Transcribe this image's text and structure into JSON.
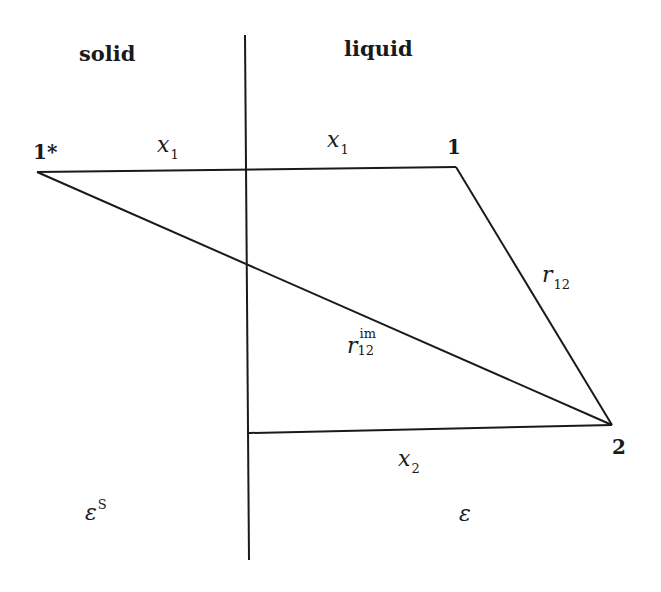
{
  "regions": {
    "left": "solid",
    "right": "liquid"
  },
  "points": {
    "image_charge": {
      "label": "1*",
      "x": 37,
      "y": 172
    },
    "charge1": {
      "label": "1",
      "x": 456,
      "y": 167
    },
    "charge2": {
      "label": "2",
      "x": 612,
      "y": 425
    }
  },
  "distances": {
    "x1_left": {
      "var": "x",
      "sub": "1"
    },
    "x1_right": {
      "var": "x",
      "sub": "1"
    },
    "x2": {
      "var": "x",
      "sub": "2"
    },
    "r12": {
      "var": "r",
      "sub": "12"
    },
    "r12_im": {
      "var": "r",
      "sub": "12",
      "sup": "im"
    }
  },
  "permittivities": {
    "solid": {
      "symbol": "ε",
      "sup": "S"
    },
    "liquid": {
      "symbol": "ε"
    }
  },
  "colors": {
    "line": "#1a1a1a",
    "background": "#ffffff"
  }
}
